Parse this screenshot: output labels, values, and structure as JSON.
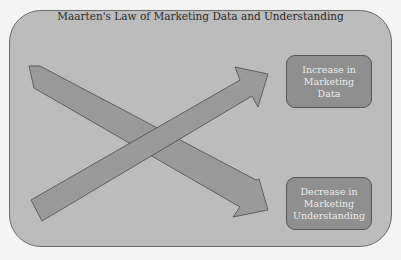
{
  "diagram": {
    "title": "Maarten's Law of Marketing Data and Understanding",
    "boxes": [
      {
        "label": "Increase in Marketing Data"
      },
      {
        "label": "Decrease in Marketing Understanding"
      }
    ],
    "arrows": [
      {
        "direction": "rising",
        "points_to": "Increase in Marketing Data"
      },
      {
        "direction": "falling",
        "points_to": "Decrease in Marketing Understanding"
      }
    ],
    "colors": {
      "page_bg": "#f4f4f4",
      "frame_bg": "#bcbcbc",
      "arrow_fill": "#9a9a9a",
      "box_fill": "#8f8f8f",
      "box_text": "#eaeaea"
    }
  }
}
